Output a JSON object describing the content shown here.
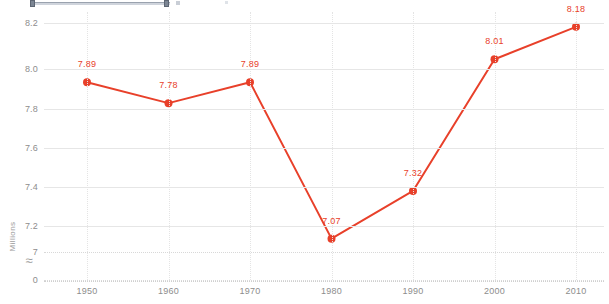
{
  "chart_data": {
    "type": "line",
    "title": "",
    "subtitle": "",
    "xlabel": "",
    "ylabel": "Millions",
    "categories": [
      "1950",
      "1960",
      "1970",
      "1980",
      "1990",
      "2000",
      "2010"
    ],
    "x": [
      1950,
      1960,
      1970,
      1980,
      1990,
      2000,
      2010
    ],
    "values": [
      7.89,
      7.78,
      7.89,
      7.07,
      7.32,
      8.01,
      8.18
    ],
    "point_labels": [
      "7.89",
      "7.78",
      "7.89",
      "7.07",
      "7.32",
      "8.01",
      "8.18"
    ],
    "series": [
      {
        "name": "Population",
        "values": [
          7.89,
          7.78,
          7.89,
          7.07,
          7.32,
          8.01,
          8.18
        ],
        "color": "#e8402a"
      }
    ],
    "ytick_labels": [
      "8.2",
      "8.0",
      "7.8",
      "7.6",
      "7.4",
      "7.2",
      "7",
      "0"
    ],
    "ytick_values": [
      8.2,
      8.0,
      7.8,
      7.6,
      7.4,
      7.2,
      7.0,
      0
    ],
    "ylim": [
      7.0,
      8.25
    ],
    "axis_break": true,
    "axis_break_symbol": "≈",
    "grid": true,
    "grid_color": "#e0e0e0",
    "legend": "none",
    "marker": "circle",
    "line_color": "#e8402a",
    "label_color": "#e8402a",
    "tick_color": "#8d8d8d"
  },
  "slider": {
    "name": "range-slider",
    "visible_portion": "partial-top-cropped"
  }
}
